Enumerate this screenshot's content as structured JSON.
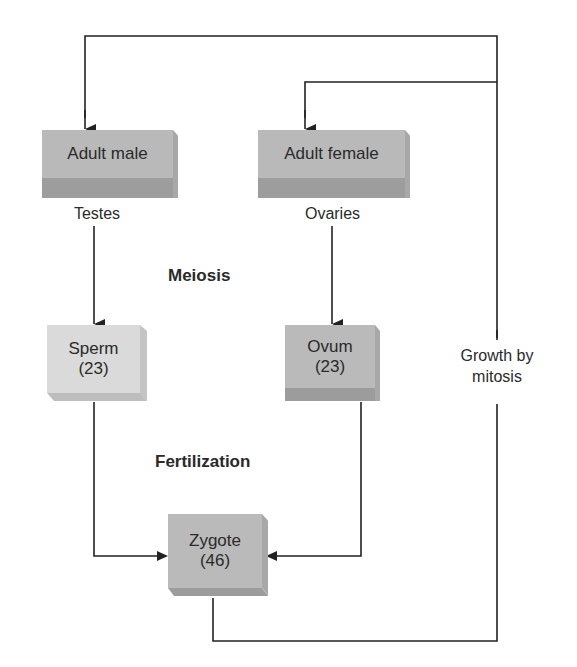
{
  "diagram": {
    "nodes": {
      "adult_male": {
        "label": "Adult male",
        "color": "#b8b8b8"
      },
      "adult_female": {
        "label": "Adult female",
        "color": "#b8b8b8"
      },
      "sperm": {
        "label": "Sperm",
        "count": "(23)",
        "color": "#d9d9d9"
      },
      "ovum": {
        "label": "Ovum",
        "count": "(23)",
        "color": "#b8b8b8"
      },
      "zygote": {
        "label": "Zygote",
        "count": "(46)",
        "color": "#b8b8b8"
      }
    },
    "labels": {
      "testes": "Testes",
      "ovaries": "Ovaries",
      "meiosis": "Meiosis",
      "fertilization": "Fertilization",
      "growth_line1": "Growth by",
      "growth_line2": "mitosis"
    }
  }
}
